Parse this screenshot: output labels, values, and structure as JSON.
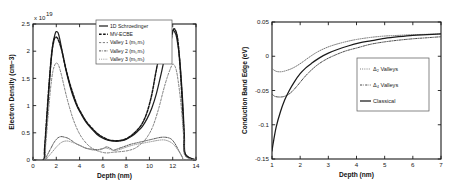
{
  "chart_data": [
    {
      "type": "line",
      "panel": "left",
      "title": "",
      "xlabel": "Depth (nm)",
      "ylabel": "Electron Density (cm−3)",
      "y_exponent_label": "x 10",
      "y_exponent_value": "19",
      "xlim": [
        0,
        14
      ],
      "ylim": [
        0,
        2.5
      ],
      "xticks": [
        0,
        2,
        4,
        6,
        8,
        10,
        12,
        14
      ],
      "xticklabels": [
        "0",
        "2",
        "4",
        "6",
        "8",
        "10",
        "12",
        "14"
      ],
      "yticks": [
        0,
        0.5,
        1,
        1.5,
        2,
        2.5
      ],
      "yticklabels": [
        "0",
        "0.5",
        "1",
        "1.5",
        "2",
        "2.5"
      ],
      "grid": false,
      "legend_position": "top-center",
      "series": [
        {
          "name": "1D Schroedinger",
          "style": "solid",
          "color": "#222222",
          "x": [
            0.0,
            0.9,
            1.0,
            1.15,
            1.3,
            1.5,
            1.7,
            1.9,
            2.0,
            2.15,
            2.3,
            2.5,
            2.8,
            3.1,
            3.4,
            3.8,
            4.2,
            4.6,
            5.0,
            5.5,
            6.0,
            6.5,
            7.0,
            7.5,
            8.0,
            8.5,
            9.0,
            9.4,
            9.8,
            10.2,
            10.6,
            11.0,
            11.3,
            11.6,
            11.85,
            12.0,
            12.15,
            12.35,
            12.6,
            12.85,
            13.0,
            13.1,
            14.0
          ],
          "y": [
            0.0,
            0.0,
            0.18,
            0.62,
            1.1,
            1.68,
            2.12,
            2.32,
            2.36,
            2.34,
            2.22,
            2.0,
            1.68,
            1.42,
            1.2,
            0.98,
            0.82,
            0.68,
            0.58,
            0.47,
            0.4,
            0.36,
            0.345,
            0.35,
            0.38,
            0.44,
            0.53,
            0.62,
            0.76,
            0.95,
            1.22,
            1.58,
            1.88,
            2.16,
            2.33,
            2.38,
            2.36,
            2.24,
            1.85,
            1.1,
            0.45,
            0.1,
            0.0
          ]
        },
        {
          "name": "MV-ECBE",
          "style": "dashed",
          "color": "#151515",
          "x": [
            0.0,
            0.9,
            1.0,
            1.2,
            1.4,
            1.6,
            1.8,
            1.95,
            2.1,
            2.3,
            2.5,
            2.8,
            3.1,
            3.4,
            3.8,
            4.2,
            4.6,
            5.0,
            5.5,
            6.0,
            6.5,
            7.0,
            7.5,
            8.0,
            8.5,
            9.0,
            9.4,
            9.8,
            10.2,
            10.5,
            10.75,
            10.95,
            11.1,
            11.3,
            11.55,
            11.8,
            12.0,
            12.2,
            12.45,
            12.7,
            12.95,
            13.05,
            14.0
          ],
          "y": [
            0.0,
            0.0,
            0.22,
            0.85,
            1.45,
            1.95,
            2.2,
            2.26,
            2.24,
            2.14,
            1.99,
            1.7,
            1.45,
            1.24,
            1.0,
            0.84,
            0.7,
            0.6,
            0.49,
            0.42,
            0.37,
            0.355,
            0.36,
            0.39,
            0.46,
            0.56,
            0.68,
            0.88,
            1.2,
            1.55,
            1.82,
            1.96,
            1.93,
            1.82,
            1.88,
            2.12,
            2.36,
            2.4,
            2.18,
            1.5,
            0.55,
            0.12,
            0.0
          ]
        },
        {
          "name": "Valley 1 (mₜ,mₗ)",
          "style": "dashed-light",
          "color": "#777777",
          "x": [
            0.0,
            0.95,
            1.1,
            1.3,
            1.5,
            1.7,
            1.9,
            2.05,
            2.2,
            2.4,
            2.6,
            2.9,
            3.2,
            3.5,
            3.9,
            4.3,
            4.8,
            5.3,
            5.8,
            6.3,
            6.8,
            7.3,
            7.8,
            8.3,
            8.8,
            9.3,
            9.8,
            10.3,
            10.8,
            11.2,
            11.5,
            11.8,
            12.0,
            12.2,
            12.4,
            12.7,
            12.95,
            13.05,
            14.0
          ],
          "y": [
            0.0,
            0.0,
            0.3,
            0.82,
            1.3,
            1.62,
            1.76,
            1.78,
            1.74,
            1.6,
            1.42,
            1.15,
            0.92,
            0.72,
            0.52,
            0.38,
            0.26,
            0.19,
            0.15,
            0.13,
            0.14,
            0.15,
            0.16,
            0.18,
            0.22,
            0.3,
            0.42,
            0.62,
            0.95,
            1.28,
            1.5,
            1.68,
            1.76,
            1.72,
            1.55,
            1.05,
            0.4,
            0.08,
            0.0
          ]
        },
        {
          "name": "Valley 2 (mₜ,mₗ)",
          "style": "dashdot",
          "color": "#4a4a4a",
          "x": [
            0.0,
            1.0,
            1.2,
            1.5,
            1.8,
            2.1,
            2.4,
            2.7,
            3.0,
            3.3,
            3.7,
            4.1,
            4.5,
            5.0,
            5.5,
            6.0,
            6.3,
            6.6,
            6.9,
            7.2,
            7.6,
            8.0,
            8.4,
            8.8,
            9.2,
            9.6,
            10.0,
            10.4,
            10.8,
            11.2,
            11.6,
            11.9,
            12.2,
            12.5,
            12.8,
            13.0,
            14.0
          ],
          "y": [
            0.0,
            0.0,
            0.08,
            0.2,
            0.32,
            0.4,
            0.43,
            0.42,
            0.4,
            0.36,
            0.3,
            0.26,
            0.22,
            0.2,
            0.19,
            0.21,
            0.24,
            0.22,
            0.18,
            0.2,
            0.23,
            0.26,
            0.29,
            0.31,
            0.33,
            0.35,
            0.37,
            0.39,
            0.41,
            0.42,
            0.41,
            0.38,
            0.3,
            0.18,
            0.06,
            0.0,
            0.0
          ]
        },
        {
          "name": "Valley 3 (mₜ,mₜ)",
          "style": "dotted",
          "color": "#8d8d8d",
          "x": [
            0.0,
            1.0,
            1.3,
            1.7,
            2.1,
            2.5,
            2.9,
            3.3,
            3.8,
            4.3,
            4.8,
            5.3,
            5.8,
            6.2,
            6.6,
            7.0,
            7.4,
            7.8,
            8.2,
            8.7,
            9.2,
            9.7,
            10.2,
            10.7,
            11.2,
            11.6,
            12.0,
            12.4,
            12.8,
            13.0,
            14.0
          ],
          "y": [
            0.0,
            0.0,
            0.06,
            0.16,
            0.26,
            0.33,
            0.35,
            0.33,
            0.29,
            0.24,
            0.2,
            0.18,
            0.19,
            0.22,
            0.2,
            0.17,
            0.19,
            0.22,
            0.25,
            0.28,
            0.3,
            0.32,
            0.34,
            0.36,
            0.37,
            0.35,
            0.3,
            0.2,
            0.07,
            0.0,
            0.0
          ]
        }
      ]
    },
    {
      "type": "line",
      "panel": "right",
      "title": "",
      "xlabel": "Depth (nm)",
      "ylabel": "Conduction Band Edge (eV)",
      "xlim": [
        1,
        7
      ],
      "ylim": [
        -0.15,
        0.05
      ],
      "xticks": [
        1,
        2,
        3,
        4,
        5,
        6,
        7
      ],
      "xticklabels": [
        "1",
        "2",
        "3",
        "4",
        "5",
        "6",
        "7"
      ],
      "yticks": [
        -0.15,
        -0.1,
        -0.05,
        0,
        0.05
      ],
      "yticklabels": [
        "-0.15",
        "-0.1",
        "-0.05",
        "0",
        "0.05"
      ],
      "grid": false,
      "legend_position": "center-right",
      "series": [
        {
          "name": "Δ₂ Valleys",
          "style": "dotted",
          "color": "#6d6d6d",
          "x": [
            1.0,
            1.1,
            1.2,
            1.35,
            1.5,
            1.7,
            1.9,
            2.1,
            2.3,
            2.6,
            2.9,
            3.2,
            3.6,
            4.0,
            4.5,
            5.0,
            5.5,
            6.0,
            6.5,
            7.0
          ],
          "y": [
            -0.018,
            -0.021,
            -0.0225,
            -0.0225,
            -0.021,
            -0.018,
            -0.0135,
            -0.008,
            -0.002,
            0.006,
            0.012,
            0.0165,
            0.021,
            0.0245,
            0.0275,
            0.0295,
            0.0305,
            0.0315,
            0.032,
            0.0325
          ]
        },
        {
          "name": "Δ₄ Valleys",
          "style": "dashdot",
          "color": "#3f3f3f",
          "x": [
            1.0,
            1.1,
            1.25,
            1.4,
            1.55,
            1.7,
            1.9,
            2.1,
            2.3,
            2.6,
            2.9,
            3.2,
            3.6,
            4.0,
            4.5,
            5.0,
            5.5,
            6.0,
            6.5,
            7.0
          ],
          "y": [
            -0.055,
            -0.0585,
            -0.0595,
            -0.059,
            -0.0565,
            -0.052,
            -0.043,
            -0.033,
            -0.024,
            -0.013,
            -0.005,
            0.001,
            0.0075,
            0.012,
            0.0175,
            0.021,
            0.0235,
            0.0255,
            0.027,
            0.0285
          ]
        },
        {
          "name": "Classical",
          "style": "solid",
          "color": "#1a1a1a",
          "x": [
            1.0,
            1.05,
            1.15,
            1.3,
            1.45,
            1.6,
            1.8,
            2.0,
            2.2,
            2.4,
            2.7,
            3.0,
            3.3,
            3.7,
            4.1,
            4.5,
            5.0,
            5.5,
            6.0,
            6.5,
            7.0
          ],
          "y": [
            -0.138,
            -0.125,
            -0.103,
            -0.081,
            -0.064,
            -0.051,
            -0.037,
            -0.0255,
            -0.017,
            -0.0105,
            -0.002,
            0.0045,
            0.0095,
            0.015,
            0.0195,
            0.0225,
            0.026,
            0.0285,
            0.0305,
            0.0315,
            0.0325
          ]
        }
      ]
    }
  ]
}
